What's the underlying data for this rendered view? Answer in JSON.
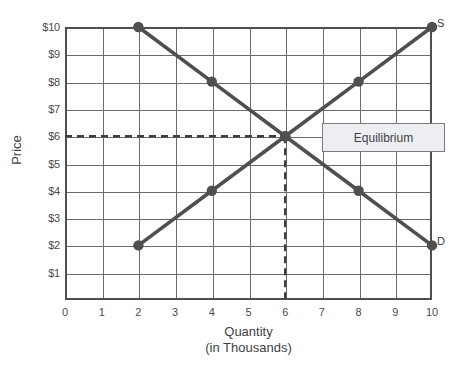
{
  "chart_data": {
    "type": "line",
    "title": "",
    "xlabel": "Quantity",
    "xlabel_sub": "(in Thousands)",
    "ylabel": "Price",
    "x": [
      0,
      1,
      2,
      3,
      4,
      5,
      6,
      7,
      8,
      9,
      10
    ],
    "xlim": [
      0,
      10
    ],
    "ylim": [
      0,
      10
    ],
    "grid": true,
    "legend_position": "none",
    "x_tick_labels": [
      "0",
      "1",
      "2",
      "3",
      "4",
      "5",
      "6",
      "7",
      "8",
      "9",
      "10"
    ],
    "y_tick_labels": [
      "$1",
      "$2",
      "$3",
      "$4",
      "$5",
      "$6",
      "$7",
      "$8",
      "$9",
      "$10"
    ],
    "y_tick_values": [
      1,
      2,
      3,
      4,
      5,
      6,
      7,
      8,
      9,
      10
    ],
    "series": [
      {
        "name": "Supply",
        "end_label": "S",
        "color": "#4f4f4f",
        "points": [
          {
            "x": 2,
            "y": 2,
            "marker": true
          },
          {
            "x": 4,
            "y": 4,
            "marker": true
          },
          {
            "x": 6,
            "y": 6,
            "marker": true
          },
          {
            "x": 8,
            "y": 8,
            "marker": true
          },
          {
            "x": 10,
            "y": 10,
            "marker": true
          }
        ]
      },
      {
        "name": "Demand",
        "end_label": "D",
        "color": "#4f4f4f",
        "points": [
          {
            "x": 2,
            "y": 10,
            "marker": true
          },
          {
            "x": 4,
            "y": 8,
            "marker": true
          },
          {
            "x": 6,
            "y": 6,
            "marker": true
          },
          {
            "x": 8,
            "y": 4,
            "marker": true
          },
          {
            "x": 10,
            "y": 2,
            "marker": true
          }
        ]
      }
    ],
    "annotations": [
      {
        "name": "equilibrium",
        "label": "Equilibrium",
        "x": 6,
        "y": 6,
        "guide_lines": "dashed"
      }
    ]
  },
  "labels": {
    "equilibrium_callout": "Equilibrium",
    "supply_curve_label": "S",
    "demand_curve_label": "D",
    "y_axis_title": "Price",
    "x_axis_title_line1": "Quantity",
    "x_axis_title_line2": "(in Thousands)"
  },
  "colors": {
    "curve": "#4f4f4f",
    "grid": "#6b6b6b",
    "axis": "#4f4f4f",
    "callout_background": "#eceef2",
    "callout_border": "#7b7b7b",
    "text": "#4a4a4a"
  }
}
